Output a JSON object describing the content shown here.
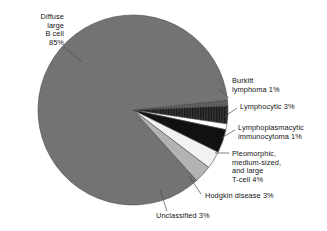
{
  "chart_data": {
    "type": "pie",
    "title": "",
    "subtitle": "",
    "xlabel": "",
    "ylabel": "",
    "legend_position": "callout-labels",
    "grid": false,
    "units": "percent",
    "categories": [
      "Diffuse large B cell",
      "Burkitt lymphoma",
      "Lymphocytic",
      "Lymphoplasmacytic immunocytoma",
      "Pleomorphic, medium-sized, and large T-cell",
      "Hodgkin disease",
      "Unclassified"
    ],
    "values": [
      85,
      1,
      3,
      1,
      4,
      3,
      3
    ],
    "slices": [
      {
        "name": "Diffuse large B cell",
        "value": 85,
        "value_label": "85%",
        "label_lines": "Diffuse\nlarge\nB cell\n85%",
        "color": "#737373",
        "pattern": "solid"
      },
      {
        "name": "Burkitt lymphoma",
        "value": 1,
        "value_label": "1%",
        "label_lines": "Burkitt\nlymphoma 1%",
        "color": "#5e5e5e",
        "pattern": "solid"
      },
      {
        "name": "Lymphocytic",
        "value": 3,
        "value_label": "3%",
        "label_lines": "Lymphocytic 3%",
        "color": "#3a3a3a",
        "pattern": "vertical-hatch"
      },
      {
        "name": "Lymphoplasmacytic immunocytoma",
        "value": 1,
        "value_label": "1%",
        "label_lines": "Lymphoplasmacytic\nimmunocytoma 1%",
        "color": "#ffffff",
        "pattern": "solid"
      },
      {
        "name": "Pleomorphic, medium-sized, and large T-cell",
        "value": 4,
        "value_label": "4%",
        "label_lines": "Pleomorphic,\nmedium-sized,\nand large\nT-cell 4%",
        "color": "#111111",
        "pattern": "solid"
      },
      {
        "name": "Hodgkin disease",
        "value": 3,
        "value_label": "3%",
        "label_lines": "Hodgkin disease 3%",
        "color": "#f2f2f2",
        "pattern": "solid"
      },
      {
        "name": "Unclassified",
        "value": 3,
        "value_label": "3%",
        "label_lines": "Unclassified 3%",
        "color": "#b3b3b3",
        "pattern": "solid"
      }
    ]
  },
  "labels": {
    "diffuse": "Diffuse\nlarge\nB cell\n85%",
    "burkitt": "Burkitt\nlymphoma 1%",
    "lymphocytic": "Lymphocytic 3%",
    "lymphoplasmacytic": "Lymphoplasmacytic\nimmunocytoma 1%",
    "pleomorphic": "Pleomorphic,\nmedium-sized,\nand large\nT-cell 4%",
    "hodgkin": "Hodgkin disease 3%",
    "unclassified": "Unclassified 3%"
  },
  "colors": {
    "diffuse_gray": "#737373",
    "burkitt_gray": "#5e5e5e",
    "lymphocytic_dark": "#3a3a3a",
    "white": "#ffffff",
    "black": "#111111",
    "hodgkin_light": "#f2f2f2",
    "unclassified_gray": "#b3b3b3",
    "outline": "#4a4a4a",
    "text": "#141414",
    "background": "#ffffff"
  }
}
